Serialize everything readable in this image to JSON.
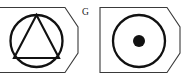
{
  "figure": {
    "kind": "technical-symbol-pair",
    "width": 190,
    "height": 79,
    "background_color": "#ffffff",
    "line_color": "#111111",
    "outline_color": "#3a3a3a"
  },
  "symbols": [
    {
      "id": "left",
      "name": "circle-with-inscribed-triangle",
      "tag_shape": "chamfered-rectangle",
      "left_edge": "cropped",
      "contents": [
        "circle",
        "equilateral-triangle"
      ],
      "label": "G",
      "label_position": "top-right-outside",
      "circle": {
        "cx": 36.5,
        "cy": 41,
        "r": 26
      },
      "triangle_points": "36.5,15 59,58 14,58"
    },
    {
      "id": "right",
      "name": "circle-with-center-dot",
      "tag_shape": "chamfered-rectangle",
      "left_edge": "visible",
      "contents": [
        "circle",
        "filled-center-dot"
      ],
      "label": "",
      "label_position": "",
      "circle": {
        "cx": 139,
        "cy": 41,
        "r": 26
      },
      "dot": {
        "cx": 139,
        "cy": 41,
        "r": 6
      }
    }
  ],
  "outlines": {
    "left_tag_path": "M -6,7.5 L 65,7.5 L 78,27 L 78,53 L 65,72.5 L -6,72.5 Z",
    "right_tag_path": "M 100,7.5 L 167,7.5 L 180,27 L 180,53 L 167,72.5 L 100,72.5 Z"
  }
}
